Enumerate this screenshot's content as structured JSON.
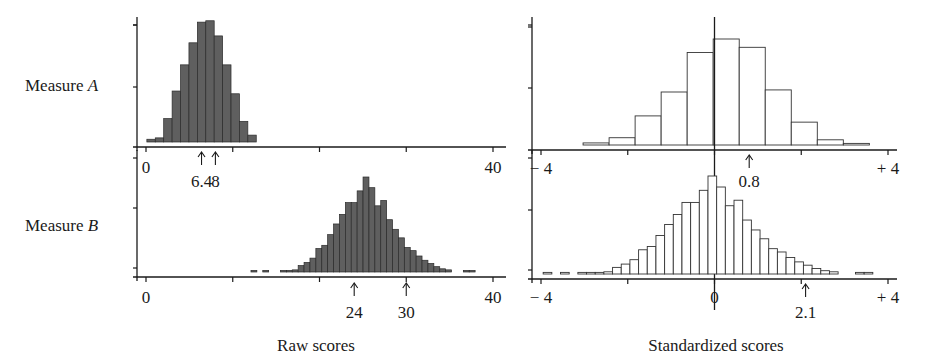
{
  "figure": {
    "row_labels": [
      {
        "text": "Measure ",
        "italic": "A"
      },
      {
        "text": "Measure ",
        "italic": "B"
      }
    ],
    "x_labels": {
      "left": "Raw scores",
      "right": "Standardized scores"
    },
    "colors": {
      "raw_fill": "#5f5f5f",
      "raw_stroke": "#2a2a2a",
      "std_fill": "#ffffff",
      "std_stroke": "#333333",
      "axis": "#1a1a1a"
    }
  },
  "chart_data": [
    {
      "id": "measureA-raw",
      "type": "bar",
      "title": "Measure A",
      "xlabel": "",
      "ylabel": "",
      "xlim": [
        0,
        40
      ],
      "tick_labels": [
        "0",
        "40"
      ],
      "ticks": [
        0,
        10,
        20,
        30,
        40
      ],
      "annotations": [
        {
          "x": 6.4,
          "label": "6.4"
        },
        {
          "x": 8,
          "label": "8"
        }
      ],
      "bin_start": 0.1,
      "bin_width": 0.97,
      "values": [
        2,
        3,
        17,
        37,
        56,
        72,
        87,
        88,
        77,
        56,
        35,
        15,
        5
      ],
      "grid": false
    },
    {
      "id": "measureA-std",
      "type": "bar",
      "title": "Measure A (standardized)",
      "xlabel": "",
      "ylabel": "",
      "xlim": [
        -4,
        4
      ],
      "tick_labels": [
        "− 4",
        "+ 4"
      ],
      "ticks": [
        -4,
        -2,
        0,
        2,
        4
      ],
      "annotations": [
        {
          "x": 0.8,
          "label": "0.8"
        }
      ],
      "bin_start": -3.03,
      "bin_width": 0.6,
      "values": [
        2,
        7,
        28,
        51,
        89,
        102,
        94,
        53,
        22,
        5,
        1
      ],
      "grid": false
    },
    {
      "id": "measureB-raw",
      "type": "bar",
      "title": "Measure B",
      "xlabel": "Raw scores",
      "ylabel": "",
      "xlim": [
        0,
        40
      ],
      "tick_labels": [
        "0",
        "40"
      ],
      "ticks": [
        0,
        10,
        20,
        30,
        40
      ],
      "annotations": [
        {
          "x": 24,
          "label": "24"
        },
        {
          "x": 30,
          "label": "30"
        }
      ],
      "bin_start": 12.1,
      "bin_width": 0.68,
      "values": [
        1,
        0,
        1,
        0,
        0,
        1,
        1,
        2,
        6,
        9,
        13,
        22,
        25,
        35,
        45,
        54,
        65,
        65,
        76,
        89,
        79,
        62,
        67,
        49,
        40,
        32,
        23,
        20,
        15,
        11,
        8,
        5,
        3,
        2,
        0,
        0,
        1,
        1
      ],
      "grid": false
    },
    {
      "id": "measureB-std",
      "type": "bar",
      "title": "Measure B (standardized)",
      "xlabel": "Standardized scores",
      "ylabel": "",
      "xlim": [
        -4,
        4
      ],
      "tick_labels": [
        "− 4",
        "0",
        "+ 4"
      ],
      "ticks": [
        -4,
        -2,
        0,
        2,
        4
      ],
      "annotations": [
        {
          "x": 2.1,
          "label": "2.1"
        }
      ],
      "bin_start": -3.95,
      "bin_width": 0.2,
      "values": [
        1,
        0,
        1,
        0,
        1,
        1,
        1,
        2,
        6,
        9,
        13,
        22,
        25,
        35,
        45,
        54,
        65,
        65,
        76,
        89,
        79,
        62,
        67,
        49,
        40,
        32,
        23,
        20,
        15,
        11,
        8,
        5,
        3,
        2,
        0,
        0,
        1,
        1
      ],
      "grid": false
    }
  ]
}
